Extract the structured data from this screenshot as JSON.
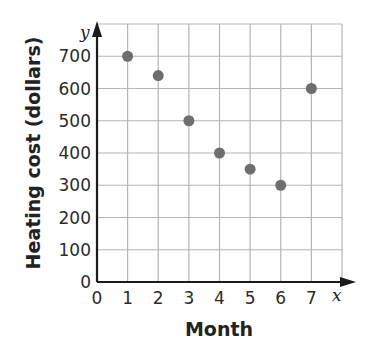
{
  "chart_data": {
    "type": "scatter",
    "title": "",
    "xlabel": "Month",
    "ylabel": "Heating cost (dollars)",
    "x_var": "x",
    "y_var": "y",
    "x": [
      1,
      2,
      3,
      4,
      5,
      6,
      7
    ],
    "y": [
      700,
      640,
      500,
      400,
      350,
      300,
      600
    ],
    "xlim": [
      0,
      8
    ],
    "ylim": [
      0,
      800
    ],
    "x_ticks": [
      0,
      1,
      2,
      3,
      4,
      5,
      6,
      7
    ],
    "y_ticks": [
      0,
      100,
      200,
      300,
      400,
      500,
      600,
      700
    ],
    "grid": true,
    "legend": null,
    "marker_color": "#6e6e6e"
  },
  "colors": {
    "grid": "#b5b5b5",
    "axis": "#1a1a1a",
    "marker": "#6e6e6e"
  }
}
